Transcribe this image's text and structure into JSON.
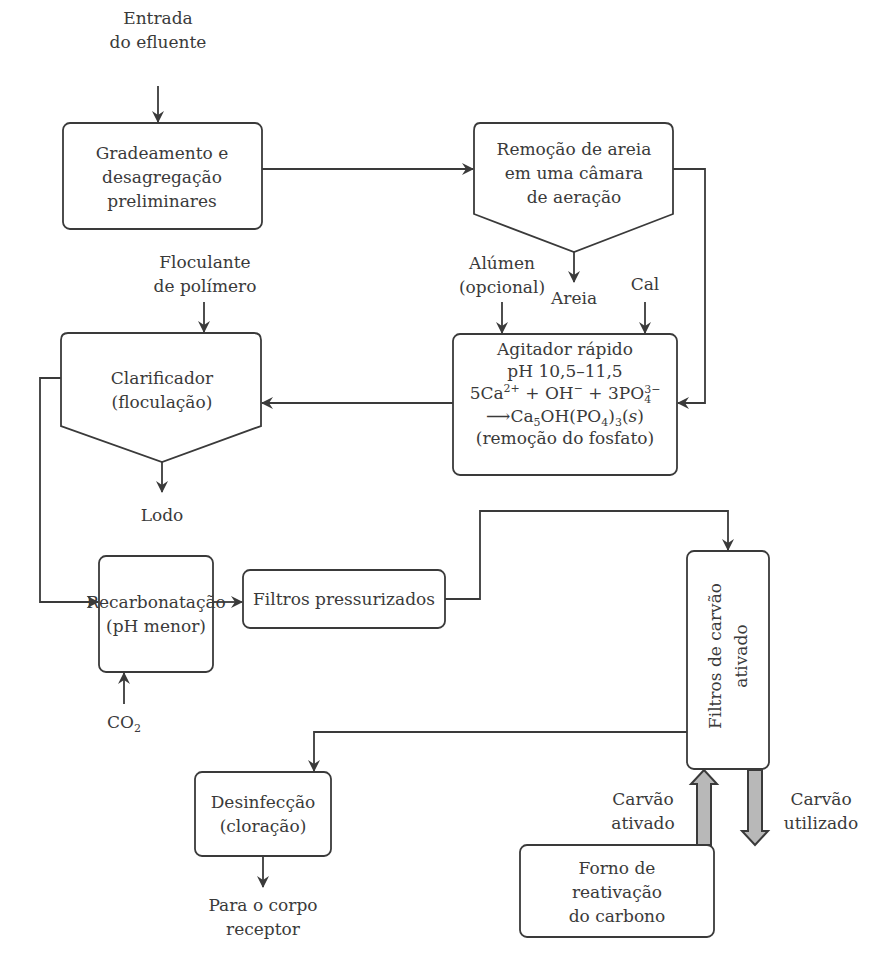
{
  "diagram": {
    "type": "flowchart",
    "colors": {
      "stroke": "#3a3a3a",
      "text": "#3a3a3a",
      "thick_arrow_fill": "#b8b8b8",
      "background": "#ffffff"
    },
    "inputs": {
      "entrada": [
        "Entrada",
        "do efluente"
      ],
      "floculante": [
        "Floculante",
        "de polímero"
      ],
      "alumen": [
        "Alúmen",
        "(opcional)"
      ],
      "cal": "Cal",
      "co2": {
        "base": "CO",
        "sub": "2"
      }
    },
    "outputs": {
      "areia": "Areia",
      "lodo": "Lodo",
      "corpo_receptor": [
        "Para o corpo",
        "receptor"
      ]
    },
    "nodes": {
      "gradeamento": [
        "Gradeamento e",
        "desagregação",
        "preliminares"
      ],
      "remocao_areia": [
        "Remoção de areia",
        "em uma câmara",
        "de aeração"
      ],
      "agitador": {
        "title": "Agitador rápido",
        "ph": "pH 10,5–11,5",
        "eq1": {
          "a": "5Ca",
          "a_sup": "2+",
          "b": " + OH",
          "b_sup": "−",
          "c": " + 3PO",
          "c_sup": "3−",
          "c_sub": "4"
        },
        "eq2": {
          "arrow": "⟶",
          "a": "Ca",
          "a_sub": "5",
          "b": "OH(PO",
          "b_sub": "4",
          "c": ")",
          "c_sub": "3",
          "d": "(",
          "e": "s",
          "f": ")"
        },
        "note": "(remoção do fosfato)"
      },
      "clarificador": [
        "Clarificador",
        "(floculação)"
      ],
      "recarbonatacao": [
        "Recarbonatação",
        "(pH menor)"
      ],
      "filtros_pressurizados": "Filtros pressurizados",
      "filtros_carvao": [
        "Filtros de carvão",
        "ativado"
      ],
      "desinfeccao": [
        "Desinfecção",
        "(cloração)"
      ],
      "forno": [
        "Forno de",
        "reativação",
        "do carbono"
      ]
    },
    "flow_labels": {
      "carvao_ativado": [
        "Carvão",
        "ativado"
      ],
      "carvao_utilizado": [
        "Carvão",
        "utilizado"
      ]
    }
  }
}
